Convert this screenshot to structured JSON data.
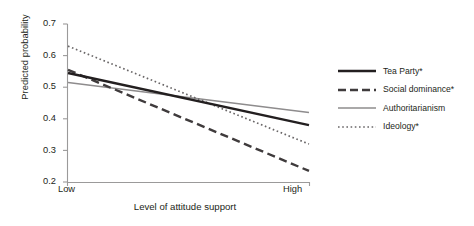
{
  "chart_data": {
    "type": "line",
    "title": "",
    "xlabel": "Level of attitude support",
    "ylabel": "Predicted probability",
    "x": [
      "Low",
      "High"
    ],
    "categories": [
      "Low",
      "High"
    ],
    "xtick_labels": [
      "Low",
      "High"
    ],
    "ytick_labels": [
      "0.7",
      "0.6",
      "0.5",
      "0.4",
      "0.3",
      "0.2"
    ],
    "yticks": [
      0.7,
      0.6,
      0.5,
      0.4,
      0.3,
      0.2
    ],
    "ylim": [
      0.2,
      0.7
    ],
    "grid": false,
    "legend_position": "right",
    "series": [
      {
        "name": "Tea Party*",
        "values": [
          0.545,
          0.38
        ],
        "style": "solid",
        "color": "#231f20",
        "width": 2.4
      },
      {
        "name": "Social dominance*",
        "values": [
          0.555,
          0.235
        ],
        "style": "dashed",
        "color": "#3f3b3c",
        "width": 2.4
      },
      {
        "name": "Authoritarianism",
        "values": [
          0.515,
          0.42
        ],
        "style": "solid",
        "color": "#8e8c8d",
        "width": 1.5
      },
      {
        "name": "Ideology*",
        "values": [
          0.63,
          0.32
        ],
        "style": "dotted",
        "color": "#6a6768",
        "width": 1.7
      }
    ]
  },
  "axis": {
    "line_color": "#9b9a9a"
  }
}
